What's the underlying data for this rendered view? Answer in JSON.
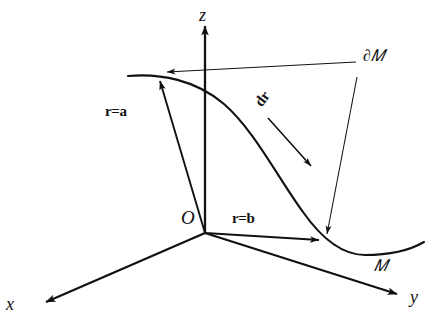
{
  "figure": {
    "type": "line-diagram",
    "background_color": "#ffffff",
    "stroke_color": "#111111"
  },
  "axes": {
    "x": {
      "label": "x",
      "origin": [
        205,
        233
      ],
      "tip": [
        44,
        303
      ]
    },
    "y": {
      "label": "y",
      "origin": [
        205,
        233
      ],
      "tip": [
        399,
        295
      ]
    },
    "z": {
      "label": "z",
      "origin": [
        205,
        233
      ],
      "tip": [
        205,
        24
      ]
    }
  },
  "origin": {
    "label": "O",
    "point": [
      205,
      233
    ]
  },
  "vectors": {
    "r_a": {
      "label": "r=a",
      "from": [
        205,
        233
      ],
      "to": [
        159,
        79
      ]
    },
    "r_b": {
      "label": "r=b",
      "from": [
        205,
        233
      ],
      "to": [
        321,
        241
      ]
    },
    "dr": {
      "label": "dr",
      "from": [
        271,
        120
      ],
      "to": [
        312,
        166
      ]
    }
  },
  "curve": {
    "label": "M",
    "name": "manifold-curve",
    "path": "M128,76 C160,73 196,80 224,104 C254,130 278,178 303,212 C322,239 342,255 365,255 C392,255 412,249 424,242"
  },
  "boundary": {
    "label": "∂M",
    "leader_horizontal": {
      "from": [
        356,
        62
      ],
      "to": [
        168,
        72
      ]
    },
    "leader_diagonal": {
      "from": [
        357,
        76
      ],
      "to": [
        326,
        236
      ]
    }
  },
  "labels": {
    "z": "z",
    "x": "x",
    "y": "y",
    "origin": "O",
    "r_equals_a": "r=a",
    "r_equals_b": "r=b",
    "dr": "dr",
    "boundary_of_M": "∂𝑀",
    "manifold_M": "𝑀"
  }
}
